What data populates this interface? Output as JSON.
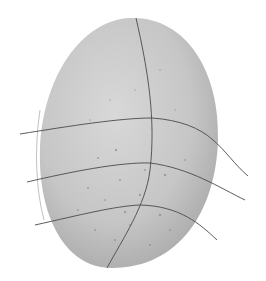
{
  "image": {
    "subject": "speckled egg with curved grid lines",
    "background_color": "#ffffff",
    "egg": {
      "fill_light": "#d4d4d4",
      "fill_mid": "#bdbdbd",
      "fill_dark": "#9e9e9e",
      "speckle_color": "#7a7a7a"
    },
    "line_color": "#4a4a4a",
    "outline_color": "#b0b0b0"
  }
}
